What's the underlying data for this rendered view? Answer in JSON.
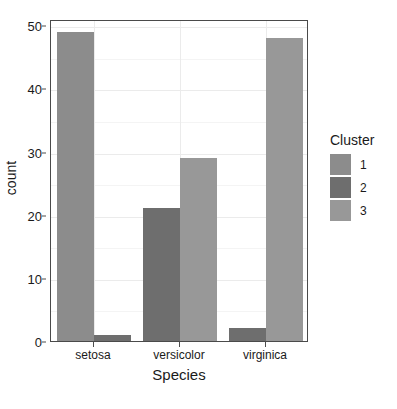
{
  "chart_data": {
    "type": "bar",
    "title": "",
    "subtitle": "",
    "xlabel": "Species",
    "ylabel": "count",
    "categories": [
      "setosa",
      "versicolor",
      "virginica"
    ],
    "series": [
      {
        "name": "1",
        "values": [
          49,
          0,
          0
        ],
        "color": "#8c8c8c"
      },
      {
        "name": "2",
        "values": [
          1,
          21,
          2
        ],
        "color": "#6e6e6e"
      },
      {
        "name": "3",
        "values": [
          0,
          29,
          48
        ],
        "color": "#989898"
      }
    ],
    "legend_title": "Cluster",
    "legend_position": "right",
    "ylim": [
      0,
      51
    ],
    "y_ticks": [
      0,
      10,
      20,
      30,
      40,
      50
    ],
    "y_tick_labels": [
      "0",
      "10",
      "20",
      "30",
      "40",
      "50"
    ],
    "y_minor_ticks": [
      5,
      15,
      25,
      35,
      45
    ],
    "grid": true,
    "panel_background": "#ffffff",
    "panel_border_color": "#4a4a4a",
    "grid_color": "#ebebeb",
    "text_color": "#1a1a1a",
    "bar_position": "dodge"
  }
}
